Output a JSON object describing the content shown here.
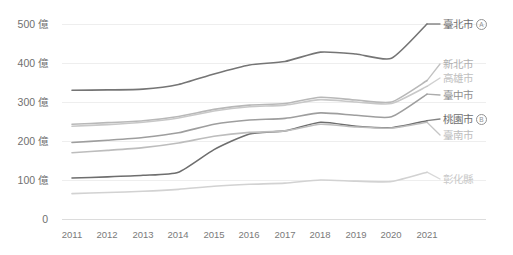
{
  "chart_data": {
    "type": "line",
    "title": "",
    "subtitle": "",
    "xlabel": "",
    "ylabel": "",
    "x": [
      2011,
      2012,
      2013,
      2014,
      2015,
      2016,
      2017,
      2018,
      2019,
      2020,
      2021
    ],
    "xtick_labels": [
      "2011",
      "2012",
      "2013",
      "2014",
      "2015",
      "2016",
      "2017",
      "2018",
      "2019",
      "2020",
      "2021"
    ],
    "ytick_labels": [
      "500 億",
      "400 億",
      "300 億",
      "200 億",
      "100 億",
      "0"
    ],
    "ytick_values": [
      500,
      400,
      300,
      200,
      100,
      0
    ],
    "ylim": [
      0,
      520
    ],
    "unit": "億",
    "grid": "horizontal",
    "legend_position": "right",
    "series": [
      {
        "name": "臺北市",
        "badge": "A",
        "color": "#757575",
        "values": [
          330,
          331,
          333,
          345,
          372,
          395,
          404,
          428,
          423,
          412,
          500
        ]
      },
      {
        "name": "新北市",
        "badge": "",
        "color": "#b8b8b8",
        "values": [
          243,
          247,
          252,
          263,
          281,
          292,
          296,
          312,
          305,
          300,
          355
        ]
      },
      {
        "name": "高雄市",
        "badge": "",
        "color": "#c8c8c8",
        "values": [
          238,
          242,
          248,
          259,
          277,
          288,
          292,
          306,
          300,
          296,
          340
        ]
      },
      {
        "name": "臺中市",
        "badge": "",
        "color": "#9e9e9e",
        "values": [
          196,
          202,
          209,
          221,
          243,
          254,
          258,
          272,
          266,
          262,
          320
        ]
      },
      {
        "name": "桃園市",
        "badge": "B",
        "color": "#6e6e6e",
        "values": [
          105,
          108,
          112,
          120,
          178,
          218,
          226,
          248,
          238,
          234,
          252
        ]
      },
      {
        "name": "臺南市",
        "badge": "",
        "color": "#bdbdbd",
        "values": [
          170,
          176,
          183,
          195,
          212,
          222,
          226,
          243,
          236,
          233,
          248
        ]
      },
      {
        "name": "彰化縣",
        "badge": "",
        "color": "#d2d2d2",
        "values": [
          65,
          68,
          71,
          76,
          84,
          89,
          92,
          100,
          97,
          96,
          120
        ]
      }
    ]
  },
  "axis": {
    "zero_label": "0"
  }
}
